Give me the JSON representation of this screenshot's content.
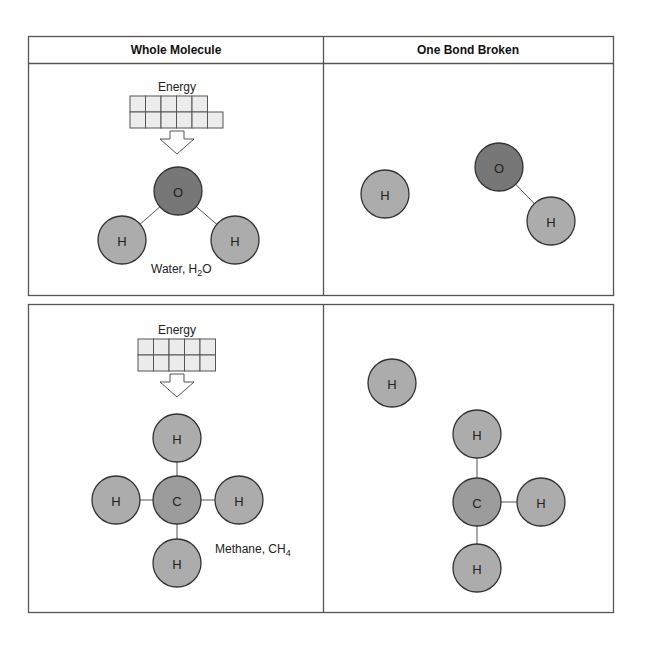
{
  "headers": {
    "left": "Whole Molecule",
    "right": "One Bond Broken"
  },
  "water": {
    "energy_label": "Energy",
    "energy_cells": {
      "top_row": 5,
      "bottom_row": 6
    },
    "caption": "Water, H",
    "caption_sub": "2",
    "caption_end": "O",
    "atoms": {
      "oxygen": "O",
      "hydrogen": "H"
    }
  },
  "methane": {
    "energy_label": "Energy",
    "energy_cells": {
      "top_row": 5,
      "bottom_row": 5
    },
    "caption": "Methane, CH",
    "caption_sub": "4",
    "atoms": {
      "carbon": "C",
      "hydrogen": "H"
    }
  },
  "colors": {
    "hydrogen": "#acacac",
    "oxygen": "#777777",
    "carbon": "#9c9c9c",
    "border": "#555555"
  }
}
